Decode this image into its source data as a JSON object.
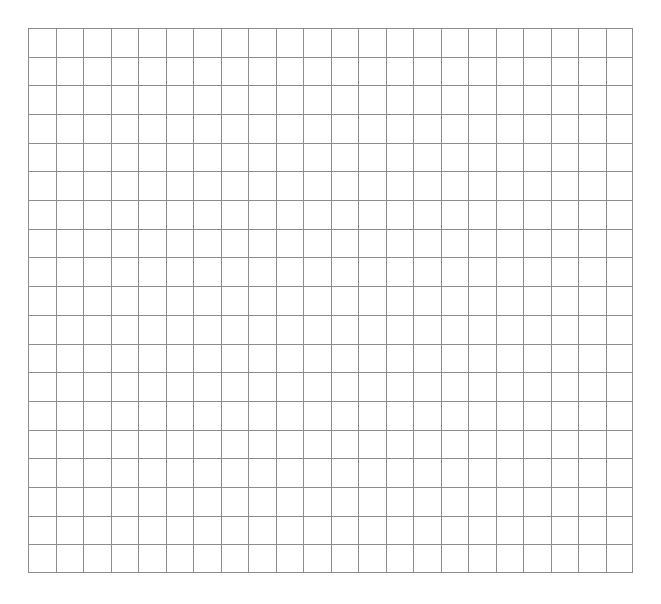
{
  "grid": {
    "columns": 22,
    "rows": 19,
    "line_color": "#8c8c8c",
    "background": "#ffffff"
  }
}
